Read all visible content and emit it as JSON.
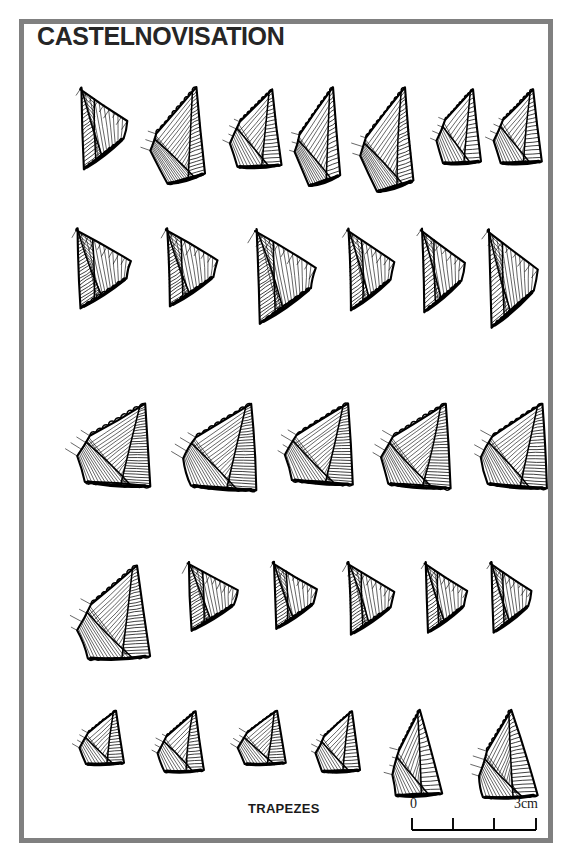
{
  "plate": {
    "title": "CASTELNOVISATION",
    "caption": "TRAPEZES",
    "frame_color": "#808080",
    "ink_color": "#000000",
    "background_color": "#ffffff"
  },
  "scale": {
    "zero_label": "0",
    "max_label": "3cm",
    "unit": "cm",
    "min_value": 0,
    "max_value": 3,
    "tick_count": 4,
    "tick_labels": [
      "0",
      "1",
      "2",
      "3"
    ]
  },
  "figure": {
    "total_artifacts": 30,
    "row_count": 5,
    "artifact_type": "trapeze microlith",
    "rows": [
      {
        "row_label": "row-1",
        "count": 7,
        "top": 55,
        "items": [
          {
            "name": "artifact-1-1",
            "x": 45,
            "w": 62,
            "h": 88,
            "shape": "asymmetric-trapeze"
          },
          {
            "name": "artifact-1-2",
            "x": 117,
            "w": 72,
            "h": 104,
            "shape": "elongated-trapeze"
          },
          {
            "name": "artifact-1-3",
            "x": 198,
            "w": 58,
            "h": 90,
            "shape": "narrow-trapeze"
          },
          {
            "name": "artifact-1-4",
            "x": 262,
            "w": 60,
            "h": 106,
            "shape": "pointed-trapeze"
          },
          {
            "name": "artifact-1-5",
            "x": 327,
            "w": 70,
            "h": 112,
            "shape": "broad-pointed-trapeze"
          },
          {
            "name": "artifact-1-6",
            "x": 405,
            "w": 50,
            "h": 86,
            "shape": "small-trapeze"
          },
          {
            "name": "artifact-1-7",
            "x": 462,
            "w": 54,
            "h": 86,
            "shape": "small-trapeze"
          }
        ]
      },
      {
        "row_label": "row-2",
        "count": 6,
        "top": 196,
        "items": [
          {
            "name": "artifact-2-1",
            "x": 40,
            "w": 72,
            "h": 86,
            "shape": "wide-symmetric-trapeze"
          },
          {
            "name": "artifact-2-2",
            "x": 130,
            "w": 68,
            "h": 84,
            "shape": "wide-symmetric-trapeze"
          },
          {
            "name": "artifact-2-3",
            "x": 218,
            "w": 80,
            "h": 102,
            "shape": "large-wide-trapeze"
          },
          {
            "name": "artifact-2-4",
            "x": 312,
            "w": 62,
            "h": 88,
            "shape": "wide-trapeze"
          },
          {
            "name": "artifact-2-5",
            "x": 386,
            "w": 58,
            "h": 90,
            "shape": "wide-trapeze"
          },
          {
            "name": "artifact-2-6",
            "x": 452,
            "w": 66,
            "h": 106,
            "shape": "large-wide-trapeze"
          }
        ]
      },
      {
        "row_label": "row-3",
        "count": 5,
        "top": 370,
        "items": [
          {
            "name": "artifact-3-1",
            "x": 44,
            "w": 84,
            "h": 92,
            "shape": "denticulated-trapeze"
          },
          {
            "name": "artifact-3-2",
            "x": 150,
            "w": 84,
            "h": 96,
            "shape": "denticulated-trapeze"
          },
          {
            "name": "artifact-3-3",
            "x": 252,
            "w": 78,
            "h": 90,
            "shape": "denticulated-trapeze"
          },
          {
            "name": "artifact-3-4",
            "x": 348,
            "w": 80,
            "h": 94,
            "shape": "denticulated-trapeze"
          },
          {
            "name": "artifact-3-5",
            "x": 448,
            "w": 76,
            "h": 94,
            "shape": "denticulated-trapeze"
          }
        ]
      },
      {
        "row_label": "row-4",
        "count": 6,
        "top": 530,
        "items": [
          {
            "name": "artifact-4-1",
            "x": 44,
            "w": 82,
            "h": 108,
            "shape": "large-irregular-trapeze"
          },
          {
            "name": "artifact-4-2",
            "x": 152,
            "w": 66,
            "h": 74,
            "shape": "asymmetric-trapeze"
          },
          {
            "name": "artifact-4-3",
            "x": 238,
            "w": 58,
            "h": 72,
            "shape": "asymmetric-trapeze"
          },
          {
            "name": "artifact-4-4",
            "x": 312,
            "w": 62,
            "h": 78,
            "shape": "asymmetric-trapeze"
          },
          {
            "name": "artifact-4-5",
            "x": 390,
            "w": 56,
            "h": 76,
            "shape": "asymmetric-trapeze"
          },
          {
            "name": "artifact-4-6",
            "x": 456,
            "w": 54,
            "h": 76,
            "shape": "asymmetric-trapeze"
          }
        ]
      },
      {
        "row_label": "row-5",
        "count": 6,
        "top": 678,
        "items": [
          {
            "name": "artifact-5-1",
            "x": 48,
            "w": 50,
            "h": 62,
            "shape": "small-trapeze"
          },
          {
            "name": "artifact-5-2",
            "x": 126,
            "w": 52,
            "h": 70,
            "shape": "small-trapeze"
          },
          {
            "name": "artifact-5-3",
            "x": 206,
            "w": 54,
            "h": 62,
            "shape": "small-trapeze"
          },
          {
            "name": "artifact-5-4",
            "x": 284,
            "w": 50,
            "h": 70,
            "shape": "small-trapeze"
          },
          {
            "name": "artifact-5-5",
            "x": 360,
            "w": 56,
            "h": 94,
            "shape": "tall-trapeze"
          },
          {
            "name": "artifact-5-6",
            "x": 446,
            "w": 66,
            "h": 96,
            "shape": "tall-broad-trapeze"
          }
        ]
      }
    ]
  }
}
